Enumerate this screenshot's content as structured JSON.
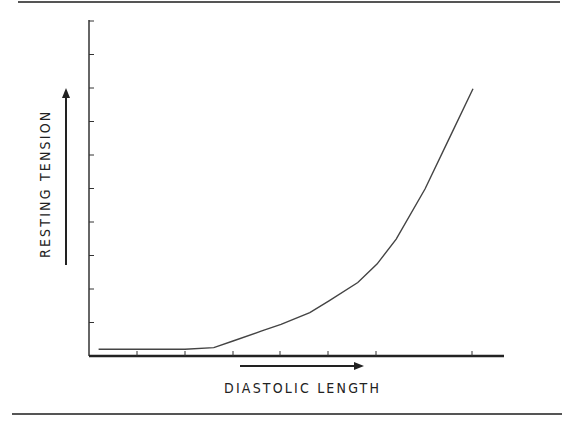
{
  "chart_data": {
    "type": "line",
    "title": "",
    "xlabel": "DIASTOLIC LENGTH",
    "ylabel": "RESTING TENSION",
    "x_tick_labels": [],
    "y_tick_labels": [],
    "xlim": [
      0,
      8
    ],
    "ylim": [
      0,
      10
    ],
    "grid": false,
    "legend": null,
    "x_arrow": true,
    "y_arrow": true,
    "series": [
      {
        "name": "Resting tension",
        "x": [
          0.2,
          1.0,
          2.0,
          2.6,
          3.0,
          3.6,
          4.0,
          4.6,
          5.0,
          5.6,
          6.0,
          6.4,
          7.0,
          7.5,
          8.0
        ],
        "y": [
          0.2,
          0.2,
          0.2,
          0.25,
          0.45,
          0.75,
          0.95,
          1.3,
          1.65,
          2.2,
          2.75,
          3.5,
          5.0,
          6.5,
          8.0
        ]
      }
    ]
  },
  "labels": {
    "x_axis": "DIASTOLIC LENGTH",
    "y_axis": "RESTING TENSION"
  },
  "colors": {
    "axis": "#222222",
    "curve": "#444444",
    "rule": "#555555"
  }
}
